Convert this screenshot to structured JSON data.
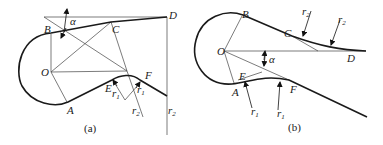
{
  "figure": {
    "panels": [
      {
        "id": "a",
        "caption": "(a)",
        "points": {
          "B": "B",
          "C": "C",
          "D": "D",
          "O": "O",
          "E": "E",
          "F": "F",
          "A": "A"
        },
        "symbols": {
          "alpha": "α",
          "r1": "r",
          "r1_sub": "1",
          "r2": "r",
          "r2_sub": "2"
        }
      },
      {
        "id": "b",
        "caption": "(b)",
        "points": {
          "B": "B",
          "C": "C",
          "D": "D",
          "O": "O",
          "E": "E",
          "F": "F",
          "A": "A"
        },
        "symbols": {
          "alpha": "α",
          "r1": "r",
          "r1_sub": "1",
          "r2": "r",
          "r2_sub": "2"
        }
      }
    ]
  }
}
